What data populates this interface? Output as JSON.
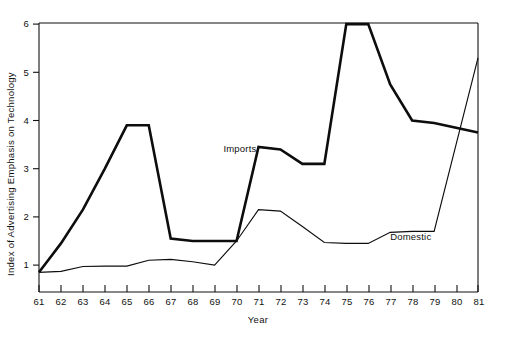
{
  "chart_data": {
    "type": "line",
    "title": "",
    "xlabel": "Year",
    "ylabel": "Index of Advertising Emphasis on Technology",
    "x": [
      61,
      62,
      63,
      64,
      65,
      66,
      67,
      68,
      69,
      70,
      71,
      72,
      73,
      74,
      75,
      76,
      77,
      78,
      79,
      80,
      81
    ],
    "xtick_labels": [
      "61",
      "62",
      "63",
      "64",
      "65",
      "66",
      "67",
      "68",
      "69",
      "70",
      "71",
      "72",
      "73",
      "74",
      "75",
      "76",
      "77",
      "78",
      "79",
      "80",
      "81"
    ],
    "ytick_labels": [
      "1",
      "2",
      "3",
      "4",
      "5",
      "6"
    ],
    "yticks": [
      1,
      2,
      3,
      4,
      5,
      6
    ],
    "xlim": [
      61,
      81
    ],
    "ylim": [
      0.3,
      6.2
    ],
    "grid": false,
    "legend_position": "inline-annotations",
    "series": [
      {
        "name": "Imports",
        "label_x": 69.4,
        "label_y": 3.35,
        "line_weight": "thick",
        "color": "#0d0d0d",
        "values": [
          0.85,
          1.45,
          2.15,
          3.0,
          3.9,
          3.9,
          1.55,
          1.5,
          1.5,
          1.5,
          3.45,
          3.4,
          3.1,
          3.1,
          6.0,
          6.0,
          4.75,
          4.0,
          3.95,
          3.85,
          3.75
        ]
      },
      {
        "name": "Domestic",
        "label_x": 77.0,
        "label_y": 1.52,
        "line_weight": "thin",
        "color": "#0d0d0d",
        "values": [
          0.85,
          0.87,
          0.97,
          0.98,
          0.98,
          1.1,
          1.12,
          1.07,
          1.0,
          1.5,
          2.15,
          2.12,
          1.8,
          1.47,
          1.45,
          1.45,
          1.68,
          1.7,
          1.7,
          3.5,
          5.3
        ]
      }
    ],
    "annotations": [
      {
        "text": "Imports",
        "series": "Imports"
      },
      {
        "text": "Domestic",
        "series": "Domestic"
      }
    ]
  },
  "colors": {
    "background": "#ffffff",
    "ink": "#111111",
    "series_line": "#0d0d0d"
  }
}
